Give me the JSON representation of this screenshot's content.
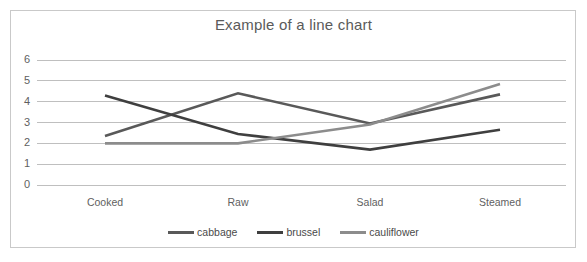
{
  "chart_data": {
    "type": "line",
    "title": "Example of a line chart",
    "xlabel": "",
    "ylabel": "",
    "categories": [
      "Cooked",
      "Raw",
      "Salad",
      "Steamed"
    ],
    "series": [
      {
        "name": "cabbage",
        "color": "#595959",
        "values": [
          2.35,
          4.4,
          2.95,
          4.35
        ]
      },
      {
        "name": "brussel",
        "color": "#3f3f3f",
        "values": [
          4.3,
          2.45,
          1.7,
          2.65
        ]
      },
      {
        "name": "cauliflower",
        "color": "#8c8c8c",
        "values": [
          2.0,
          2.0,
          2.9,
          4.85
        ]
      }
    ],
    "ylim": [
      0,
      6
    ],
    "yticks": [
      "0",
      "1",
      "2",
      "3",
      "4",
      "5",
      "6"
    ],
    "grid": true,
    "legend_position": "bottom",
    "gridline_color": "#bfbfbf",
    "border_color": "#c9c9c9",
    "title_color": "#5a5a5a",
    "tick_label_color": "#5f5f5f"
  },
  "legend": {
    "entries": [
      {
        "label": "cabbage"
      },
      {
        "label": "brussel"
      },
      {
        "label": "cauliflower"
      }
    ]
  }
}
